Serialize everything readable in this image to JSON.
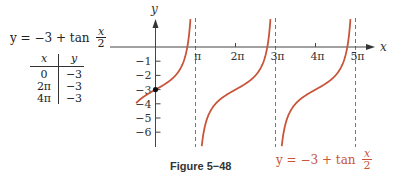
{
  "left_panel": {
    "formula": {
      "prefix": "y = −3 + tan",
      "frac_num": "x",
      "frac_den": "2"
    },
    "table": {
      "headers": [
        "x",
        "y"
      ],
      "rows": [
        [
          "0",
          "−3"
        ],
        [
          "2π",
          "−3"
        ],
        [
          "4π",
          "−3"
        ]
      ]
    }
  },
  "graph_label": {
    "prefix": "y = −3 + tan",
    "frac_num": "x",
    "frac_den": "2",
    "color": "#c8553a"
  },
  "caption": "Figure 5−48",
  "chart_data": {
    "type": "line",
    "title": "",
    "function": "y = -3 + tan(x/2)",
    "xlabel": "x",
    "ylabel": "y",
    "x_ticks": [
      "π",
      "2π",
      "3π",
      "4π",
      "5π"
    ],
    "x_tick_values_in_pi": [
      1,
      2,
      3,
      4,
      5
    ],
    "y_ticks": [
      "−1",
      "−2",
      "−3",
      "−4",
      "−5",
      "−6"
    ],
    "y_tick_values": [
      -1,
      -2,
      -3,
      -4,
      -5,
      -6
    ],
    "asymptotes_in_pi": [
      1,
      3,
      5
    ],
    "highlighted_points": [
      {
        "x": 0,
        "y": -3
      }
    ],
    "table_points": [
      {
        "x": "0",
        "y": -3
      },
      {
        "x": "2π",
        "y": -3
      },
      {
        "x": "4π",
        "y": -3
      }
    ],
    "xlim_in_pi": [
      -0.95,
      5.5
    ],
    "ylim": [
      -7,
      2
    ],
    "curve_color": "#c8553a",
    "grid": false
  }
}
